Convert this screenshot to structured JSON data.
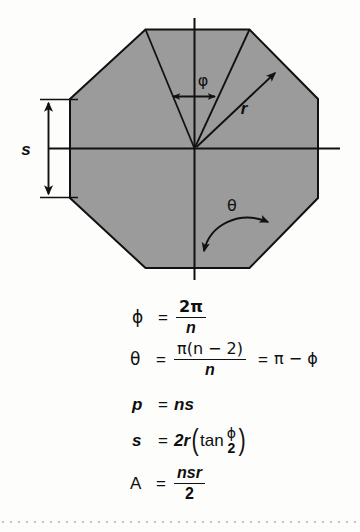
{
  "figure": {
    "background_color": "#fdfdfc",
    "ink_color": "#111111"
  },
  "diagram": {
    "shape_name": "regular octagon",
    "fill_color": "#9b9b9b",
    "stroke_color": "#111111",
    "sides": 8,
    "labels": {
      "side_label": "s",
      "radius_label": "r",
      "central_angle_label": "ϕ",
      "interior_angle_label": "θ"
    },
    "annotations": {
      "side_dimension_name": "s-dimension-arrow",
      "radius_arrow_name": "r-radius-arrow",
      "phi_arc_name": "phi-angle-arrow",
      "theta_arc_name": "theta-angle-arc"
    }
  },
  "formulas": [
    {
      "id": "phi",
      "lhs": "ϕ",
      "lhs_style": "greek",
      "eq": "=",
      "rhs_type": "fraction",
      "numerator": "2π",
      "denominator": "n",
      "plain": "ϕ = 2π / n"
    },
    {
      "id": "theta",
      "lhs": "θ",
      "lhs_style": "greek",
      "eq": "=",
      "rhs_type": "fraction-plus-tail",
      "numerator": "π(n − 2)",
      "denominator": "n",
      "eq2": "=",
      "tail": "π − ϕ",
      "plain": "θ = π(n − 2) / n = π − ϕ"
    },
    {
      "id": "p",
      "lhs": "p",
      "lhs_style": "italic",
      "eq": "=",
      "rhs_type": "inline",
      "rhs": "ns",
      "plain": "p = ns"
    },
    {
      "id": "s",
      "lhs": "s",
      "lhs_style": "italic",
      "eq": "=",
      "rhs_type": "tan-expression",
      "coefficient": "2r",
      "function": "tan",
      "arg_numerator": "ϕ",
      "arg_denominator": "2",
      "plain": "s = 2r (tan ϕ/2)"
    },
    {
      "id": "A",
      "lhs": "A",
      "lhs_style": "upright",
      "eq": "=",
      "rhs_type": "fraction",
      "numerator": "nsr",
      "denominator": "2",
      "plain": "A = nsr / 2"
    }
  ],
  "footer": {
    "rule_style": "dotted",
    "rule_color": "#b9b9b9"
  }
}
